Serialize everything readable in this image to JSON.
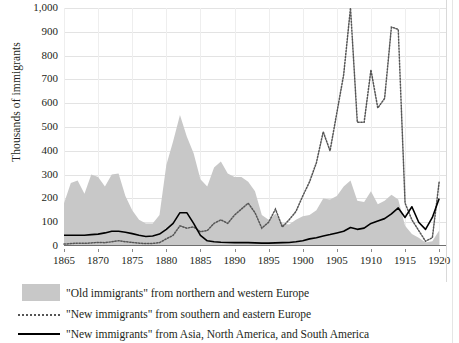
{
  "chart_data": {
    "type": "area",
    "title": "",
    "xlabel": "",
    "ylabel": "Thousands of immigrants",
    "xlim": [
      1865,
      1921
    ],
    "ylim": [
      0,
      1000
    ],
    "grid": true,
    "legend_position": "bottom-left",
    "y_ticks": [
      "0",
      "100",
      "200",
      "300",
      "400",
      "500",
      "600",
      "700",
      "800",
      "900",
      "1,000"
    ],
    "y_tick_values": [
      0,
      100,
      200,
      300,
      400,
      500,
      600,
      700,
      800,
      900,
      1000
    ],
    "x_ticks": [
      "1865",
      "1870",
      "1875",
      "1880",
      "1885",
      "1890",
      "1895",
      "1900",
      "1905",
      "1910",
      "1915",
      "1920"
    ],
    "x_tick_values": [
      1865,
      1870,
      1875,
      1880,
      1885,
      1890,
      1895,
      1900,
      1905,
      1910,
      1915,
      1920
    ],
    "colors": {
      "old_immigrants_fill": "#c8c8c8",
      "new_europe_line": "#555555",
      "new_other_line": "#000000",
      "gridline": "#e3e3e3",
      "axis": "#6f6f6f",
      "text": "#231f20"
    },
    "x": [
      1865,
      1866,
      1867,
      1868,
      1869,
      1870,
      1871,
      1872,
      1873,
      1874,
      1875,
      1876,
      1877,
      1878,
      1879,
      1880,
      1881,
      1882,
      1883,
      1884,
      1885,
      1886,
      1887,
      1888,
      1889,
      1890,
      1891,
      1892,
      1893,
      1894,
      1895,
      1896,
      1897,
      1898,
      1899,
      1900,
      1901,
      1902,
      1903,
      1904,
      1905,
      1906,
      1907,
      1908,
      1909,
      1910,
      1911,
      1912,
      1913,
      1914,
      1915,
      1916,
      1917,
      1918,
      1919,
      1920
    ],
    "series": [
      {
        "name": "\"Old immigrants\" from northern and western Europe",
        "style": "area",
        "values": [
          180,
          265,
          275,
          220,
          300,
          290,
          250,
          300,
          305,
          210,
          150,
          110,
          95,
          95,
          130,
          340,
          440,
          550,
          460,
          390,
          280,
          250,
          330,
          355,
          305,
          290,
          290,
          270,
          230,
          130,
          110,
          135,
          95,
          90,
          110,
          125,
          130,
          150,
          200,
          195,
          210,
          250,
          275,
          190,
          185,
          230,
          175,
          190,
          215,
          195,
          85,
          50,
          35,
          15,
          20,
          65
        ]
      },
      {
        "name": "\"New immigrants\" from southern and eastern Europe",
        "style": "dotted",
        "values": [
          8,
          10,
          12,
          11,
          13,
          15,
          14,
          18,
          22,
          18,
          15,
          12,
          10,
          11,
          14,
          30,
          45,
          85,
          75,
          80,
          60,
          65,
          95,
          110,
          95,
          130,
          155,
          180,
          140,
          75,
          100,
          155,
          80,
          110,
          145,
          210,
          270,
          350,
          480,
          400,
          560,
          720,
          1000,
          520,
          520,
          740,
          580,
          620,
          920,
          910,
          180,
          110,
          65,
          20,
          35,
          270
        ]
      },
      {
        "name": "\"New immigrants\" from Asia, North America, and South America",
        "style": "solid",
        "values": [
          45,
          45,
          45,
          45,
          48,
          50,
          55,
          62,
          62,
          58,
          52,
          45,
          40,
          42,
          50,
          70,
          95,
          140,
          140,
          95,
          45,
          22,
          18,
          16,
          15,
          14,
          14,
          14,
          13,
          12,
          12,
          13,
          14,
          15,
          18,
          22,
          30,
          35,
          42,
          48,
          55,
          62,
          78,
          70,
          75,
          95,
          105,
          115,
          135,
          160,
          120,
          165,
          100,
          70,
          120,
          200
        ]
      }
    ]
  },
  "legend": {
    "items": [
      {
        "marker": "area-swatch",
        "label": "\"Old immigrants\" from northern and western Europe"
      },
      {
        "marker": "dotted-line-swatch",
        "label": "\"New immigrants\" from southern and eastern Europe"
      },
      {
        "marker": "solid-line-swatch",
        "label": "\"New immigrants\" from Asia, North America, and South America"
      }
    ]
  }
}
